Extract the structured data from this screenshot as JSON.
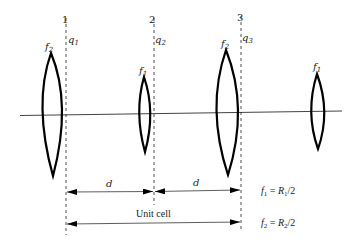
{
  "diagram": {
    "planes": [
      {
        "number": "1",
        "q_label": "q",
        "q_sub": "1"
      },
      {
        "number": "2",
        "q_label": "q",
        "q_sub": "2"
      },
      {
        "number": "3",
        "q_label": "q",
        "q_sub": "3"
      }
    ],
    "lenses": [
      {
        "label": "f",
        "sub": "2"
      },
      {
        "label": "f",
        "sub": "1"
      },
      {
        "label": "f",
        "sub": "2"
      },
      {
        "label": "f",
        "sub": "1"
      }
    ],
    "dimensions": {
      "spacing_1": "d",
      "spacing_2": "d",
      "unit_cell": "Unit cell"
    },
    "equations": [
      {
        "lhs": "f",
        "lhs_sub": "1",
        "eq": " = ",
        "rhs": "R",
        "rhs_sub": "1",
        "tail": "/2"
      },
      {
        "lhs": "f",
        "lhs_sub": "2",
        "eq": " = ",
        "rhs": "R",
        "rhs_sub": "2",
        "tail": "/2"
      }
    ],
    "colors": {
      "stroke": "#000000",
      "background": "#ffffff"
    }
  }
}
